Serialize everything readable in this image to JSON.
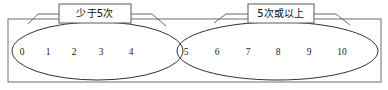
{
  "diagram": {
    "type": "venn-set-diagram",
    "universe": {
      "name": "universal-set-rectangle",
      "x": 8,
      "y": 19,
      "width": 373,
      "height": 63
    },
    "sets": [
      {
        "id": "set-left",
        "label": "少于5次",
        "callout": {
          "x": 59,
          "y": 4,
          "width": 72,
          "height": 19,
          "text_x": 95,
          "text_y": 14
        },
        "ellipse": {
          "cx": 97.5,
          "cy": 51,
          "rx": 85.5,
          "ry": 29
        },
        "members": [
          {
            "value": "0",
            "x": 22,
            "y": 53
          },
          {
            "value": "1",
            "x": 48,
            "y": 53
          },
          {
            "value": "2",
            "x": 74,
            "y": 53
          },
          {
            "value": "3",
            "x": 101,
            "y": 53
          },
          {
            "value": "4",
            "x": 131,
            "y": 53
          }
        ]
      },
      {
        "id": "set-right",
        "label": "5次或以上",
        "callout": {
          "x": 248,
          "y": 4,
          "width": 66,
          "height": 19,
          "text_x": 281,
          "text_y": 14
        },
        "ellipse": {
          "cx": 277.5,
          "cy": 51,
          "rx": 100.5,
          "ry": 29
        },
        "members": [
          {
            "value": "5",
            "x": 186,
            "y": 53
          },
          {
            "value": "6",
            "x": 217,
            "y": 53
          },
          {
            "value": "7",
            "x": 248,
            "y": 53
          },
          {
            "value": "8",
            "x": 278,
            "y": 53
          },
          {
            "value": "9",
            "x": 309,
            "y": 53
          },
          {
            "value": "10",
            "x": 342,
            "y": 53
          }
        ]
      }
    ],
    "leaders": [
      {
        "name": "leader-left-set-west",
        "points": "59,14 38,14 28,24"
      },
      {
        "name": "leader-left-set-east",
        "points": "131,14 152,14 166,26"
      },
      {
        "name": "leader-right-set-west",
        "points": "248,14 226,14 214,23"
      },
      {
        "name": "leader-right-set-east",
        "points": "314,14 336,14 350,25"
      }
    ],
    "colors": {
      "universe_stroke": "#6f6f6f",
      "ellipse_stroke": "#1a1a1a",
      "callout_stroke": "#5a5a5a",
      "leader_stroke": "#5a5a5a",
      "text": "#1a1a1a",
      "background": "#ffffff"
    }
  }
}
